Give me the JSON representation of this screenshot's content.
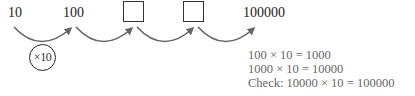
{
  "sequence": {
    "values": [
      "10",
      "100",
      "",
      "",
      "100000"
    ],
    "blanks": [
      2,
      3
    ]
  },
  "multiplier_label": "×10",
  "working": {
    "line1": "100 × 10 = 1000",
    "line2": "1000 × 10 = 10000",
    "line3": "Check: 10000 × 10 = 100000"
  },
  "colors": {
    "arrow": "#666666",
    "text": "#222222",
    "working_text": "#666666"
  }
}
